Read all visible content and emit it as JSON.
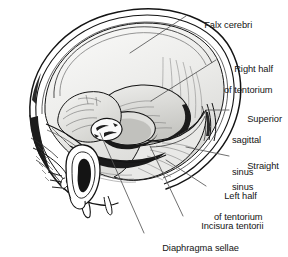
{
  "figure": {
    "type": "anatomical-line-illustration",
    "view": "left lateral, calvaria and left cerebral hemisphere removed",
    "background_color": "#ffffff",
    "ink_color": "#141414",
    "interior_fill_color": "#f1f1ef",
    "shadow_fill_color": "#c9c9c6",
    "dark_fill_color": "#1a1a1a",
    "leader_color": "#555555"
  },
  "labels": [
    {
      "id": "falx-cerebri",
      "line1": "Falx cerebri",
      "line2": "",
      "x": 189,
      "y": 9,
      "leader": {
        "x1": 186,
        "y1": 16,
        "x2": 130,
        "y2": 53
      }
    },
    {
      "id": "right-half-of-tentorium",
      "line1": "Right half",
      "line2": "of tentorium",
      "x": 219,
      "y": 53,
      "leader": {
        "x1": 216,
        "y1": 60,
        "x2": 151,
        "y2": 101
      }
    },
    {
      "id": "superior-sagittal-sinus",
      "line1": "Superior",
      "line2": "sagittal",
      "line3": "sinus",
      "x": 232,
      "y": 103,
      "leader": {
        "x1": 229,
        "y1": 110,
        "x2": 206,
        "y2": 110
      }
    },
    {
      "id": "straight-sinus",
      "line1": "Straight",
      "line2": "sinus",
      "x": 232,
      "y": 150,
      "leader": {
        "x1": 229,
        "y1": 156,
        "x2": 186,
        "y2": 147
      }
    },
    {
      "id": "left-half-of-tentorium",
      "line1": "Left half",
      "line2": "of tentorium",
      "x": 209,
      "y": 180,
      "leader": {
        "x1": 206,
        "y1": 186,
        "x2": 166,
        "y2": 160
      }
    },
    {
      "id": "incisura-tentorii",
      "line1": "Incisura tentorii",
      "line2": "",
      "x": 186,
      "y": 210,
      "leader": {
        "x1": 183,
        "y1": 216,
        "x2": 150,
        "y2": 146
      }
    },
    {
      "id": "diaphragma-sellae",
      "line1": "Diaphragma sellae",
      "line2": "",
      "x": 147,
      "y": 232,
      "leader": {
        "x1": 144,
        "y1": 233,
        "x2": 100,
        "y2": 133
      }
    }
  ]
}
